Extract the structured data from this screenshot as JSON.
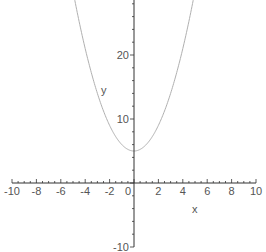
{
  "chart_data": {
    "type": "line",
    "title": "",
    "xlabel": "x",
    "ylabel": "y",
    "xlim": [
      -10,
      10
    ],
    "ylim": [
      -10,
      28.6
    ],
    "x_ticks": [
      -10,
      -8,
      -6,
      -4,
      -2,
      0,
      2,
      4,
      6,
      8,
      10
    ],
    "x_tick_labels": [
      "-10",
      "-8",
      "-6",
      "-4",
      "-2",
      "0",
      "2",
      "4",
      "6",
      "8",
      "10"
    ],
    "y_ticks": [
      -10,
      10,
      20
    ],
    "y_tick_labels": [
      "-10",
      "10",
      "20"
    ],
    "grid": false,
    "legend": null,
    "series": [
      {
        "name": "x^2+5",
        "color": "#b0b0b0",
        "x": [
          -4.8,
          -4,
          -3,
          -2,
          -1,
          0,
          1,
          2,
          3,
          4,
          4.8
        ],
        "values": [
          28.04,
          21,
          14,
          9,
          6,
          5,
          6,
          9,
          14,
          21,
          28.04
        ]
      }
    ],
    "axis_color": "#333333"
  }
}
